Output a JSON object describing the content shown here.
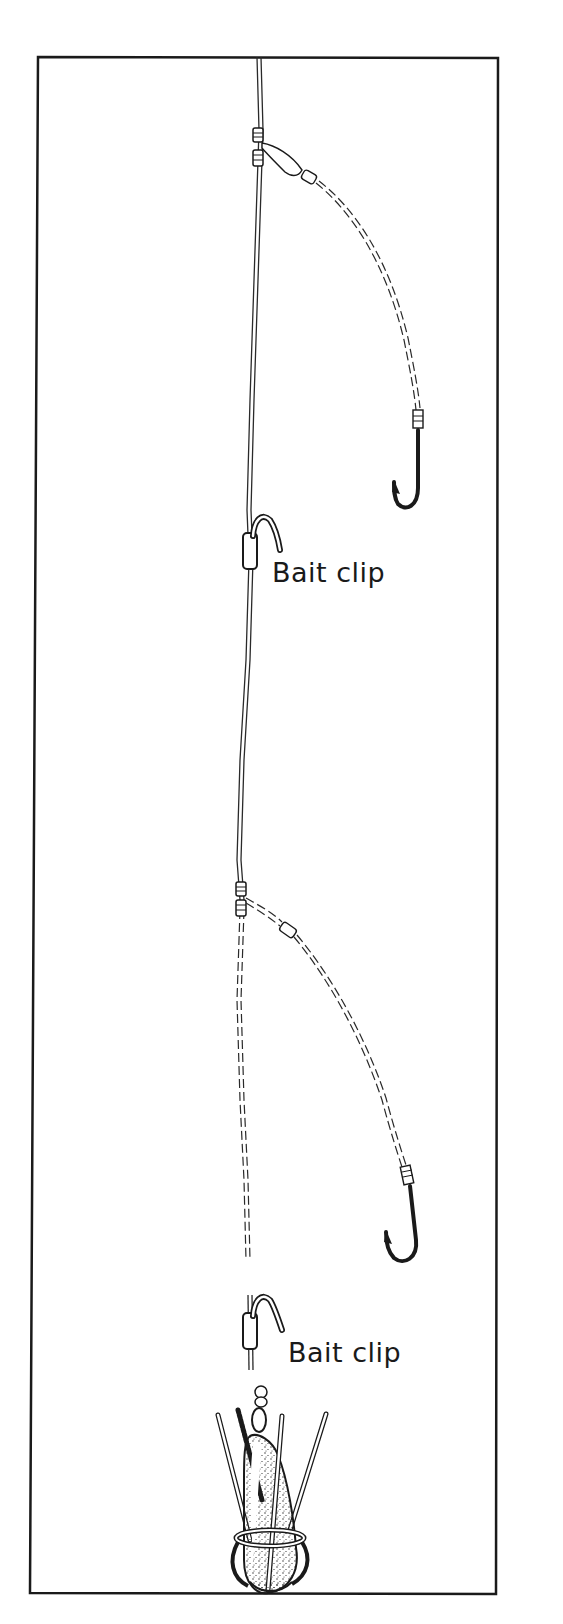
{
  "figure": {
    "labels": {
      "upper_clip": "Bait clip",
      "lower_clip": "Bait clip"
    },
    "components": [
      {
        "name": "main line",
        "type": "line"
      },
      {
        "name": "upper dropper",
        "type": "snood with hook"
      },
      {
        "name": "upper bait clip",
        "type": "clip"
      },
      {
        "name": "lower dropper",
        "type": "snood with hook"
      },
      {
        "name": "lower bait clip",
        "type": "clip"
      },
      {
        "name": "grip lead",
        "type": "sinker with wire grips"
      }
    ],
    "colors": {
      "ink": "#1a1a1a",
      "background": "#ffffff"
    }
  }
}
